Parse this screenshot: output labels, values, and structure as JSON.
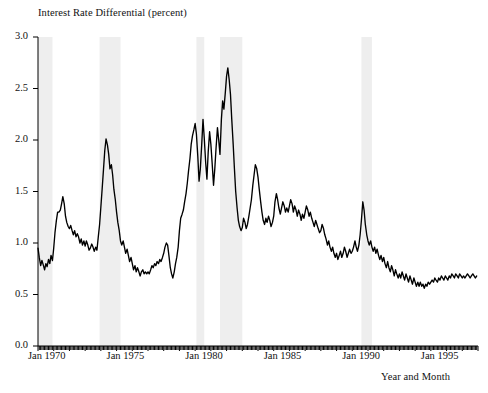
{
  "chart_data": {
    "type": "line",
    "title": "",
    "ylabel": "Interest Rate Differential (percent)",
    "xlabel": "Year and Month",
    "ylim": [
      0.0,
      3.0
    ],
    "ytick_labels": [
      "0.0",
      "0.5",
      "1.0",
      "1.5",
      "2.0",
      "2.5",
      "3.0"
    ],
    "ytick_values": [
      0.0,
      0.5,
      1.0,
      1.5,
      2.0,
      2.5,
      3.0
    ],
    "xlim": [
      "Jan 1970",
      "Dec 1997"
    ],
    "xtick_labels": [
      "Jan 1970",
      "Jan 1975",
      "Jan 1980",
      "Jan 1985",
      "Jan 1990",
      "Jan 1995"
    ],
    "xtick_values": [
      1970.0,
      1975.0,
      1980.0,
      1985.0,
      1990.0,
      1995.0
    ],
    "grid": false,
    "legend": "none",
    "line_color": "#000000",
    "band_color": "#eeeeee",
    "minor_ticks": "monthly ticks along the bottom axis",
    "shaded_bands": [
      {
        "label": "recession 1969-1970",
        "start": 1970.0,
        "end": 1970.92
      },
      {
        "label": "recession 1973-1975",
        "start": 1973.92,
        "end": 1975.25
      },
      {
        "label": "recession 1980",
        "start": 1980.08,
        "end": 1980.58
      },
      {
        "label": "recession 1981-1982",
        "start": 1981.58,
        "end": 1983.0
      },
      {
        "label": "recession 1990-1991",
        "start": 1990.58,
        "end": 1991.25
      }
    ],
    "series": [
      {
        "name": "Interest Rate Differential",
        "x": [
          1970.0,
          1970.08,
          1970.17,
          1970.25,
          1970.33,
          1970.42,
          1970.5,
          1970.58,
          1970.67,
          1970.75,
          1970.83,
          1970.92,
          1971.0,
          1971.08,
          1971.17,
          1971.25,
          1971.33,
          1971.42,
          1971.5,
          1971.58,
          1971.67,
          1971.75,
          1971.83,
          1971.92,
          1972.0,
          1972.08,
          1972.17,
          1972.25,
          1972.33,
          1972.42,
          1972.5,
          1972.58,
          1972.67,
          1972.75,
          1972.83,
          1972.92,
          1973.0,
          1973.08,
          1973.17,
          1973.25,
          1973.33,
          1973.42,
          1973.5,
          1973.58,
          1973.67,
          1973.75,
          1973.83,
          1973.92,
          1974.0,
          1974.08,
          1974.17,
          1974.25,
          1974.33,
          1974.42,
          1974.5,
          1974.58,
          1974.67,
          1974.75,
          1974.83,
          1974.92,
          1975.0,
          1975.08,
          1975.17,
          1975.25,
          1975.33,
          1975.42,
          1975.5,
          1975.58,
          1975.67,
          1975.75,
          1975.83,
          1975.92,
          1976.0,
          1976.08,
          1976.17,
          1976.25,
          1976.33,
          1976.42,
          1976.5,
          1976.58,
          1976.67,
          1976.75,
          1976.83,
          1976.92,
          1977.0,
          1977.08,
          1977.17,
          1977.25,
          1977.33,
          1977.42,
          1977.5,
          1977.58,
          1977.67,
          1977.75,
          1977.83,
          1977.92,
          1978.0,
          1978.08,
          1978.17,
          1978.25,
          1978.33,
          1978.42,
          1978.5,
          1978.58,
          1978.67,
          1978.75,
          1978.83,
          1978.92,
          1979.0,
          1979.08,
          1979.17,
          1979.25,
          1979.33,
          1979.42,
          1979.5,
          1979.58,
          1979.67,
          1979.75,
          1979.83,
          1979.92,
          1980.0,
          1980.08,
          1980.17,
          1980.25,
          1980.33,
          1980.42,
          1980.5,
          1980.58,
          1980.67,
          1980.75,
          1980.83,
          1980.92,
          1981.0,
          1981.08,
          1981.17,
          1981.25,
          1981.33,
          1981.42,
          1981.5,
          1981.58,
          1981.67,
          1981.75,
          1981.83,
          1981.92,
          1982.0,
          1982.08,
          1982.17,
          1982.25,
          1982.33,
          1982.42,
          1982.5,
          1982.58,
          1982.67,
          1982.75,
          1982.83,
          1982.92,
          1983.0,
          1983.08,
          1983.17,
          1983.25,
          1983.33,
          1983.42,
          1983.5,
          1983.58,
          1983.67,
          1983.75,
          1983.83,
          1983.92,
          1984.0,
          1984.08,
          1984.17,
          1984.25,
          1984.33,
          1984.42,
          1984.5,
          1984.58,
          1984.67,
          1984.75,
          1984.83,
          1984.92,
          1985.0,
          1985.08,
          1985.17,
          1985.25,
          1985.33,
          1985.42,
          1985.5,
          1985.58,
          1985.67,
          1985.75,
          1985.83,
          1985.92,
          1986.0,
          1986.08,
          1986.17,
          1986.25,
          1986.33,
          1986.42,
          1986.5,
          1986.58,
          1986.67,
          1986.75,
          1986.83,
          1986.92,
          1987.0,
          1987.08,
          1987.17,
          1987.25,
          1987.33,
          1987.42,
          1987.5,
          1987.58,
          1987.67,
          1987.75,
          1987.83,
          1987.92,
          1988.0,
          1988.08,
          1988.17,
          1988.25,
          1988.33,
          1988.42,
          1988.5,
          1988.58,
          1988.67,
          1988.75,
          1988.83,
          1988.92,
          1989.0,
          1989.08,
          1989.17,
          1989.25,
          1989.33,
          1989.42,
          1989.5,
          1989.58,
          1989.67,
          1989.75,
          1989.83,
          1989.92,
          1990.0,
          1990.08,
          1990.17,
          1990.25,
          1990.33,
          1990.42,
          1990.5,
          1990.58,
          1990.67,
          1990.75,
          1990.83,
          1990.92,
          1991.0,
          1991.08,
          1991.17,
          1991.25,
          1991.33,
          1991.42,
          1991.5,
          1991.58,
          1991.67,
          1991.75,
          1991.83,
          1991.92,
          1992.0,
          1992.08,
          1992.17,
          1992.25,
          1992.33,
          1992.42,
          1992.5,
          1992.58,
          1992.67,
          1992.75,
          1992.83,
          1992.92,
          1993.0,
          1993.08,
          1993.17,
          1993.25,
          1993.33,
          1993.42,
          1993.5,
          1993.58,
          1993.67,
          1993.75,
          1993.83,
          1993.92,
          1994.0,
          1994.08,
          1994.17,
          1994.25,
          1994.33,
          1994.42,
          1994.5,
          1994.58,
          1994.67,
          1994.75,
          1994.83,
          1994.92,
          1995.0,
          1995.08,
          1995.17,
          1995.25,
          1995.33,
          1995.42,
          1995.5,
          1995.58,
          1995.67,
          1995.75,
          1995.83,
          1995.92,
          1996.0,
          1996.08,
          1996.17,
          1996.25,
          1996.33,
          1996.42,
          1996.5,
          1996.58,
          1996.67,
          1996.75,
          1996.83,
          1996.92,
          1997.0,
          1997.08,
          1997.17,
          1997.25,
          1997.33,
          1997.42,
          1997.5,
          1997.58,
          1997.67,
          1997.75,
          1997.83,
          1997.92
        ],
        "values": [
          0.95,
          0.86,
          0.78,
          0.83,
          0.79,
          0.74,
          0.8,
          0.77,
          0.84,
          0.8,
          0.88,
          0.83,
          0.95,
          1.1,
          1.22,
          1.3,
          1.3,
          1.32,
          1.38,
          1.45,
          1.38,
          1.26,
          1.2,
          1.16,
          1.14,
          1.17,
          1.12,
          1.08,
          1.12,
          1.06,
          1.09,
          1.06,
          1.0,
          1.04,
          0.98,
          1.02,
          0.97,
          1.02,
          0.98,
          0.93,
          0.95,
          0.99,
          0.96,
          0.92,
          0.96,
          0.93,
          1.05,
          1.18,
          1.35,
          1.52,
          1.72,
          1.9,
          2.01,
          1.95,
          1.86,
          1.72,
          1.76,
          1.66,
          1.52,
          1.42,
          1.3,
          1.2,
          1.12,
          1.02,
          0.98,
          1.02,
          0.96,
          0.9,
          0.94,
          0.88,
          0.82,
          0.86,
          0.8,
          0.74,
          0.78,
          0.72,
          0.76,
          0.72,
          0.68,
          0.72,
          0.74,
          0.7,
          0.72,
          0.7,
          0.72,
          0.7,
          0.74,
          0.78,
          0.76,
          0.8,
          0.78,
          0.82,
          0.8,
          0.84,
          0.82,
          0.86,
          0.9,
          0.96,
          1.0,
          0.98,
          0.88,
          0.76,
          0.7,
          0.66,
          0.72,
          0.8,
          0.86,
          0.96,
          1.12,
          1.24,
          1.28,
          1.32,
          1.4,
          1.48,
          1.58,
          1.7,
          1.82,
          1.96,
          2.04,
          2.1,
          2.16,
          2.06,
          1.84,
          1.6,
          1.72,
          1.96,
          2.2,
          2.02,
          1.78,
          1.62,
          1.88,
          2.08,
          1.96,
          1.78,
          1.56,
          1.72,
          1.92,
          2.12,
          2.0,
          1.86,
          2.2,
          2.38,
          2.3,
          2.46,
          2.62,
          2.7,
          2.58,
          2.44,
          2.2,
          1.96,
          1.72,
          1.5,
          1.34,
          1.22,
          1.16,
          1.12,
          1.15,
          1.24,
          1.2,
          1.14,
          1.18,
          1.26,
          1.34,
          1.42,
          1.56,
          1.66,
          1.76,
          1.72,
          1.64,
          1.52,
          1.4,
          1.3,
          1.22,
          1.18,
          1.24,
          1.2,
          1.26,
          1.22,
          1.16,
          1.2,
          1.26,
          1.4,
          1.48,
          1.42,
          1.34,
          1.28,
          1.34,
          1.4,
          1.36,
          1.3,
          1.34,
          1.3,
          1.36,
          1.42,
          1.38,
          1.3,
          1.36,
          1.32,
          1.26,
          1.32,
          1.28,
          1.22,
          1.28,
          1.24,
          1.3,
          1.36,
          1.32,
          1.26,
          1.3,
          1.24,
          1.2,
          1.16,
          1.22,
          1.18,
          1.14,
          1.1,
          1.12,
          1.18,
          1.14,
          1.08,
          1.04,
          0.98,
          1.02,
          0.96,
          0.92,
          0.96,
          0.9,
          0.86,
          0.9,
          0.84,
          0.88,
          0.92,
          0.86,
          0.9,
          0.96,
          0.92,
          0.86,
          0.9,
          0.94,
          0.9,
          0.92,
          0.96,
          1.02,
          0.96,
          0.92,
          0.98,
          1.08,
          1.22,
          1.4,
          1.32,
          1.18,
          1.08,
          1.02,
          0.98,
          1.02,
          0.96,
          0.92,
          0.96,
          0.9,
          0.94,
          0.88,
          0.84,
          0.88,
          0.82,
          0.86,
          0.8,
          0.76,
          0.82,
          0.76,
          0.72,
          0.78,
          0.74,
          0.68,
          0.74,
          0.7,
          0.66,
          0.7,
          0.66,
          0.72,
          0.68,
          0.64,
          0.7,
          0.66,
          0.62,
          0.68,
          0.64,
          0.6,
          0.66,
          0.62,
          0.58,
          0.62,
          0.58,
          0.62,
          0.58,
          0.6,
          0.56,
          0.6,
          0.58,
          0.62,
          0.6,
          0.62,
          0.64,
          0.62,
          0.66,
          0.64,
          0.62,
          0.66,
          0.64,
          0.68,
          0.66,
          0.64,
          0.68,
          0.66,
          0.64,
          0.68,
          0.66,
          0.7,
          0.68,
          0.66,
          0.7,
          0.68,
          0.66,
          0.7,
          0.68,
          0.66,
          0.68,
          0.66,
          0.68,
          0.7,
          0.68,
          0.66,
          0.68,
          0.7,
          0.68,
          0.66,
          0.68
        ]
      }
    ]
  }
}
